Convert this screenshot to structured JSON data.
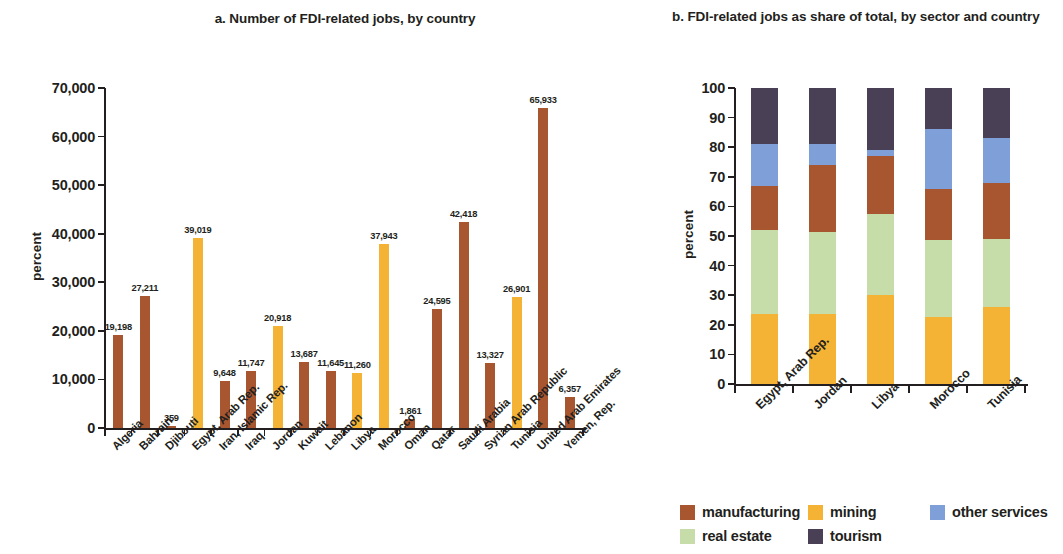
{
  "chart_data": [
    {
      "type": "bar",
      "panel": "a",
      "title": "a.  Number of FDI-related jobs, by country",
      "xlabel": "",
      "ylabel": "percent",
      "ylim": [
        0,
        70000
      ],
      "yticks": [
        "0",
        "10,000",
        "20,000",
        "30,000",
        "40,000",
        "50,000",
        "60,000",
        "70,000"
      ],
      "ytick_values": [
        0,
        10000,
        20000,
        30000,
        40000,
        50000,
        60000,
        70000
      ],
      "grid": false,
      "categories": [
        "Algeria",
        "Bahrain",
        "Djibouti",
        "Egypt, Arab Rep.",
        "Iran, Islamic Rep.",
        "Iraq",
        "Jordan",
        "Kuwait",
        "Lebanon",
        "Libya",
        "Morocco",
        "Oman",
        "Qatar",
        "Saudi Arabia",
        "Syrian Arab Republic",
        "Tunisia",
        "United Arab Emirates",
        "Yemen, Rep."
      ],
      "values": [
        19198,
        27211,
        359,
        39019,
        9648,
        11747,
        20918,
        13687,
        11645,
        11260,
        37943,
        1861,
        24595,
        42418,
        13327,
        26901,
        65933,
        6357
      ],
      "labels": [
        "19,198",
        "27,211",
        "359",
        "39,019",
        "9,648",
        "11,747",
        "20,918",
        "13,687",
        "11,645",
        "11,260",
        "37,943",
        "1,861",
        "24,595",
        "42,418",
        "13,327",
        "26,901",
        "65,933",
        "6,357"
      ],
      "bar_colors": [
        "#A8562F",
        "#A8562F",
        "#A8562F",
        "#F5B335",
        "#A8562F",
        "#A8562F",
        "#F5B335",
        "#A8562F",
        "#A8562F",
        "#F5B335",
        "#F5B335",
        "#A8562F",
        "#A8562F",
        "#A8562F",
        "#A8562F",
        "#F5B335",
        "#A8562F",
        "#A8562F"
      ]
    },
    {
      "type": "bar",
      "subtype": "stacked",
      "panel": "b",
      "title": "b.  FDI-related jobs as share of total, by sector and country",
      "xlabel": "",
      "ylabel": "percent",
      "ylim": [
        0,
        100
      ],
      "yticks": [
        "0",
        "10",
        "20",
        "30",
        "40",
        "50",
        "60",
        "70",
        "80",
        "90",
        "100"
      ],
      "ytick_values": [
        0,
        10,
        20,
        30,
        40,
        50,
        60,
        70,
        80,
        90,
        100
      ],
      "grid": false,
      "legend_position": "bottom",
      "categories": [
        "Egypt, Arab Rep.",
        "Jordan",
        "Libya",
        "Morocco",
        "Tunisia"
      ],
      "series": [
        {
          "name": "mining",
          "color": "#F5B335",
          "values": [
            23.5,
            23.5,
            30.0,
            22.5,
            26.0
          ]
        },
        {
          "name": "real estate",
          "color": "#C6DCA9",
          "values": [
            28.5,
            28.0,
            27.5,
            26.0,
            23.0
          ]
        },
        {
          "name": "manufacturing",
          "color": "#A8562F",
          "values": [
            15.0,
            22.5,
            19.5,
            17.5,
            19.0
          ]
        },
        {
          "name": "other services",
          "color": "#7E9FD8",
          "values": [
            14.0,
            7.0,
            2.0,
            20.0,
            15.0
          ]
        },
        {
          "name": "tourism",
          "color": "#4A4055",
          "values": [
            19.0,
            19.0,
            21.0,
            14.0,
            17.0
          ]
        }
      ],
      "stack_order_bottom_to_top": [
        "mining",
        "real estate",
        "manufacturing",
        "other services",
        "tourism"
      ]
    }
  ],
  "legend": {
    "items": [
      {
        "label": "manufacturing",
        "color": "#A8562F"
      },
      {
        "label": "mining",
        "color": "#F5B335"
      },
      {
        "label": "other services",
        "color": "#7E9FD8"
      },
      {
        "label": "real estate",
        "color": "#C6DCA9"
      },
      {
        "label": "tourism",
        "color": "#4A4055"
      }
    ]
  }
}
